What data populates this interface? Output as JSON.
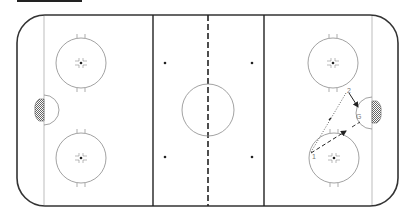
{
  "diagram": {
    "type": "hockey-rink-drill",
    "colors": {
      "boards": "#333333",
      "lines": "#222222",
      "circles": "#8a8a8a",
      "goal_line": "#bdbdbd",
      "net": "#777777",
      "pass": "#555555",
      "skate": "#222222"
    },
    "labels": {
      "player_1": "1",
      "player_2": "2",
      "goalie": "G"
    },
    "drill": {
      "steps": [
        {
          "from": "player_1",
          "to": "player_2",
          "style": "dotted",
          "meaning": "pass"
        },
        {
          "from": "player_2",
          "to": "net-front",
          "style": "solid-arrow",
          "meaning": "skate"
        },
        {
          "from": "player_1",
          "to": "slot",
          "style": "dashed-arrow",
          "meaning": "skate"
        }
      ]
    }
  }
}
